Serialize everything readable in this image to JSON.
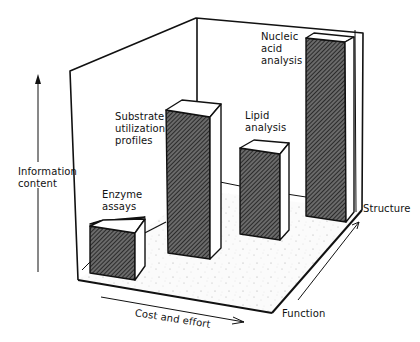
{
  "diagram": {
    "type": "3d-bar-illustration",
    "y_axis_label": [
      "Information",
      "content"
    ],
    "x_axis_label": "Cost and effort",
    "depth_axis_labels": {
      "near": "Function",
      "far": "Structure"
    },
    "bars": [
      {
        "label": [
          "Enzyme",
          "assays"
        ],
        "relative_height": 1
      },
      {
        "label": [
          "Substrate",
          "utilization",
          "profiles"
        ],
        "relative_height": 3.4
      },
      {
        "label": [
          "Lipid",
          "analysis"
        ],
        "relative_height": 2.5
      },
      {
        "label": [
          "Nucleic",
          "acid",
          "analysis"
        ],
        "relative_height": 4.5
      }
    ],
    "colors": {
      "line": "#111111",
      "bar_face_hatch": "#333333",
      "floor_speckle": "#bdbdbd",
      "background": "#ffffff"
    }
  }
}
